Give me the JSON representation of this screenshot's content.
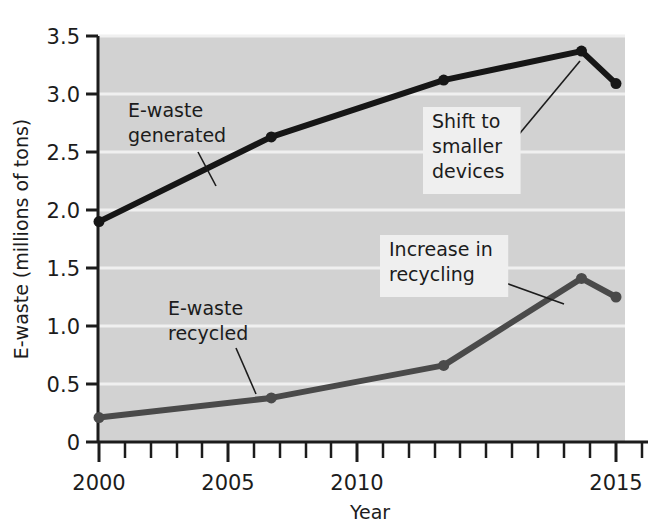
{
  "chart_data": {
    "type": "line",
    "title": "",
    "xlabel": "Year",
    "ylabel": "E-waste (millions of tons)",
    "xlim": [
      2000,
      2015.6
    ],
    "ylim": [
      0,
      3.5
    ],
    "grid": true,
    "grid_color": "#f2f2f2",
    "plot_background": "#d2d2d2",
    "legend_position": "none",
    "x_tick_labels": [
      "2000",
      "2005",
      "2010",
      "2015"
    ],
    "x_tick_values": [
      2000,
      2005,
      2010,
      2015
    ],
    "x_minor_ticks": [
      2001,
      2002,
      2003,
      2004,
      2006,
      2007,
      2008,
      2009,
      2011,
      2012,
      2013,
      2014
    ],
    "y_tick_labels": [
      "0",
      "0.5",
      "1.0",
      "1.5",
      "2.0",
      "2.5",
      "3.0",
      "3.5"
    ],
    "y_tick_values": [
      0,
      0.5,
      1.0,
      1.5,
      2.0,
      2.5,
      3.0,
      3.5
    ],
    "x": [
      2000,
      2005,
      2010,
      2014,
      2015
    ],
    "series": [
      {
        "name": "E-waste generated",
        "color": "#161616",
        "line_width": 6,
        "marker": "circle",
        "values": [
          1.9,
          2.63,
          3.12,
          3.37,
          3.09
        ]
      },
      {
        "name": "E-waste recycled",
        "color": "#4a4a4a",
        "line_width": 6,
        "marker": "circle",
        "values": [
          0.21,
          0.38,
          0.66,
          1.41,
          1.25
        ]
      }
    ],
    "annotations": [
      {
        "id": "e-waste-generated",
        "lines": [
          "E-waste",
          "generated"
        ],
        "boxed": false,
        "text_x": 128,
        "text_y": 117,
        "leader": {
          "x1": 198,
          "y1": 152,
          "x2": 216,
          "y2": 186
        }
      },
      {
        "id": "shift-to-smaller-devices",
        "lines": [
          "Shift to",
          "smaller",
          "devices"
        ],
        "boxed": true,
        "text_x": 432,
        "text_y": 128,
        "leader": {
          "x1": 506,
          "y1": 150,
          "x2": 580,
          "y2": 61
        }
      },
      {
        "id": "increase-in-recycling",
        "lines": [
          "Increase in",
          "recycling"
        ],
        "boxed": true,
        "text_x": 389,
        "text_y": 256,
        "leader": {
          "x1": 489,
          "y1": 277,
          "x2": 564,
          "y2": 304
        }
      },
      {
        "id": "e-waste-recycled",
        "lines": [
          "E-waste",
          "recycled"
        ],
        "boxed": false,
        "text_x": 168,
        "text_y": 315,
        "leader": {
          "x1": 236,
          "y1": 348,
          "x2": 256,
          "y2": 394
        }
      }
    ]
  }
}
